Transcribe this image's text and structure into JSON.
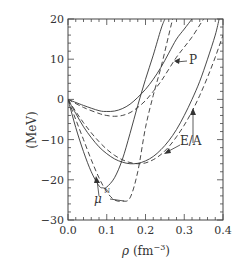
{
  "chart_data": {
    "type": "line",
    "title": "",
    "xlabel": "ρ (fm⁻³)",
    "ylabel": "(MeV)",
    "xlim": [
      0.0,
      0.4
    ],
    "ylim": [
      -30,
      20
    ],
    "x_ticks": [
      "0.0",
      "0.1",
      "0.2",
      "0.3",
      "0.4"
    ],
    "y_ticks": [
      "20",
      "10",
      "0",
      "-10",
      "-20",
      "-30"
    ],
    "grid": false,
    "annotations": [
      "P",
      "E/A",
      "μ^N"
    ],
    "series": [
      {
        "name": "μN solid",
        "style": "solid",
        "x": [
          0.0,
          0.02,
          0.04,
          0.06,
          0.08,
          0.09,
          0.1,
          0.12,
          0.14,
          0.16,
          0.18,
          0.2,
          0.22,
          0.24,
          0.25
        ],
        "y": [
          0,
          -7,
          -13,
          -18,
          -21.5,
          -22,
          -21.8,
          -19.5,
          -15,
          -8.5,
          -1.5,
          5,
          11,
          17.5,
          20
        ]
      },
      {
        "name": "μN dashed",
        "style": "dashed",
        "x": [
          0.0,
          0.02,
          0.04,
          0.06,
          0.08,
          0.1,
          0.12,
          0.14,
          0.16,
          0.18,
          0.2,
          0.22,
          0.24,
          0.26,
          0.27
        ],
        "y": [
          0,
          -5,
          -10,
          -15,
          -19.5,
          -23,
          -25,
          -25.3,
          -24.5,
          -18,
          -7,
          1,
          8,
          16,
          20
        ]
      },
      {
        "name": "E/A solid",
        "style": "solid",
        "x": [
          0.0,
          0.02,
          0.04,
          0.06,
          0.08,
          0.1,
          0.12,
          0.14,
          0.16,
          0.18,
          0.2,
          0.22,
          0.24,
          0.26,
          0.28,
          0.3,
          0.32,
          0.34,
          0.36,
          0.38,
          0.39
        ],
        "y": [
          0,
          -3.5,
          -6.8,
          -9.5,
          -11.8,
          -13.5,
          -14.8,
          -15.6,
          -16,
          -15.9,
          -15.3,
          -14.2,
          -12.5,
          -10.3,
          -7.5,
          -4,
          0,
          4.5,
          10,
          16,
          20
        ]
      },
      {
        "name": "E/A dashed",
        "style": "dashed",
        "x": [
          0.0,
          0.02,
          0.04,
          0.06,
          0.08,
          0.1,
          0.12,
          0.14,
          0.16,
          0.18,
          0.2,
          0.22,
          0.24,
          0.26,
          0.28,
          0.3,
          0.32,
          0.34,
          0.36,
          0.38,
          0.4
        ],
        "y": [
          0,
          -3,
          -5.8,
          -8.3,
          -10.5,
          -12.4,
          -13.9,
          -15,
          -15.7,
          -16,
          -15.8,
          -15,
          -13.7,
          -11.8,
          -9.3,
          -6.4,
          -3,
          1,
          5.5,
          10.5,
          16
        ]
      },
      {
        "name": "P solid",
        "style": "solid",
        "x": [
          0.0,
          0.04,
          0.08,
          0.1,
          0.12,
          0.14,
          0.16,
          0.18,
          0.2,
          0.22,
          0.24,
          0.26,
          0.28,
          0.3,
          0.32
        ],
        "y": [
          0,
          -1.5,
          -2.8,
          -3,
          -2.9,
          -2.3,
          -1.2,
          0.5,
          2.5,
          5,
          8,
          11.5,
          15,
          17.5,
          20
        ]
      },
      {
        "name": "P dashed",
        "style": "dashed",
        "x": [
          0.0,
          0.04,
          0.08,
          0.1,
          0.12,
          0.14,
          0.16,
          0.18,
          0.2,
          0.22,
          0.24,
          0.26,
          0.28,
          0.3,
          0.32,
          0.34,
          0.35
        ],
        "y": [
          0,
          -2,
          -3.5,
          -4,
          -4.2,
          -4,
          -3.3,
          -2,
          -0.3,
          2,
          4.5,
          7.5,
          10.5,
          13,
          15.5,
          18.5,
          20
        ]
      }
    ]
  }
}
